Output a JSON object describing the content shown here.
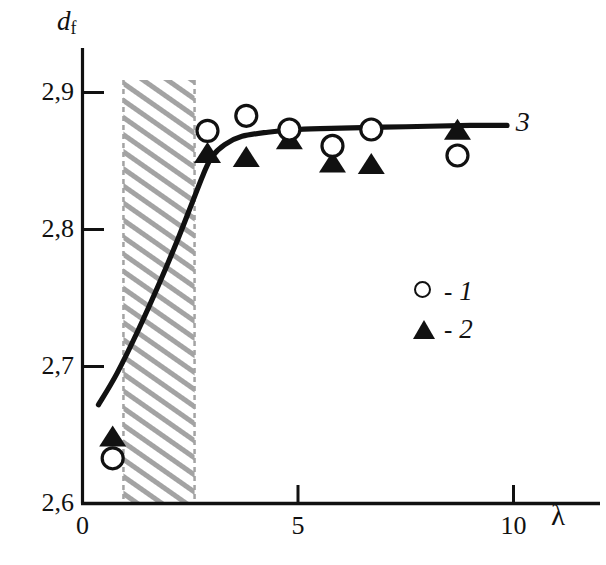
{
  "chart_data": {
    "type": "scatter",
    "title": "",
    "xlabel": "λ",
    "ylabel": "d_f",
    "ylabel_base": "d",
    "ylabel_sub": "f",
    "xlim": [
      0,
      11.6
    ],
    "ylim": [
      2.6,
      2.93
    ],
    "grid": false,
    "xticks": [
      0,
      5,
      10
    ],
    "xtick_labels": [
      "0",
      "5",
      "10"
    ],
    "yticks": [
      2.6,
      2.7,
      2.8,
      2.9
    ],
    "ytick_labels": [
      "2,6",
      "2,7",
      "2,8",
      "2,9"
    ],
    "decimal_separator": ",",
    "legend_position": "center-right",
    "series": [
      {
        "name": "1",
        "legend_label": "1",
        "legend_dash": "-",
        "marker": "open-circle",
        "marker_color": "#111111",
        "points": [
          {
            "x": 0.7,
            "y": 2.633
          },
          {
            "x": 2.9,
            "y": 2.872
          },
          {
            "x": 3.8,
            "y": 2.883
          },
          {
            "x": 4.8,
            "y": 2.873
          },
          {
            "x": 5.8,
            "y": 2.861
          },
          {
            "x": 6.7,
            "y": 2.873
          },
          {
            "x": 8.7,
            "y": 2.854
          }
        ]
      },
      {
        "name": "2",
        "legend_label": "2",
        "legend_dash": "-",
        "marker": "filled-triangle",
        "marker_color": "#111111",
        "points": [
          {
            "x": 0.7,
            "y": 2.648
          },
          {
            "x": 2.9,
            "y": 2.855
          },
          {
            "x": 3.8,
            "y": 2.852
          },
          {
            "x": 4.8,
            "y": 2.865
          },
          {
            "x": 5.8,
            "y": 2.848
          },
          {
            "x": 6.7,
            "y": 2.847
          },
          {
            "x": 8.7,
            "y": 2.872
          }
        ]
      },
      {
        "name": "3",
        "legend_label": "3",
        "marker": "line",
        "marker_color": "#111111",
        "label_x": 10.05,
        "label_y": 2.877,
        "curve": [
          {
            "x": 0.37,
            "y": 2.672
          },
          {
            "x": 0.8,
            "y": 2.695
          },
          {
            "x": 1.3,
            "y": 2.727
          },
          {
            "x": 1.8,
            "y": 2.762
          },
          {
            "x": 2.2,
            "y": 2.792
          },
          {
            "x": 2.55,
            "y": 2.82
          },
          {
            "x": 2.8,
            "y": 2.84
          },
          {
            "x": 3.0,
            "y": 2.853
          },
          {
            "x": 3.3,
            "y": 2.862
          },
          {
            "x": 3.7,
            "y": 2.868
          },
          {
            "x": 4.3,
            "y": 2.871
          },
          {
            "x": 5.0,
            "y": 2.873
          },
          {
            "x": 6.0,
            "y": 2.874
          },
          {
            "x": 7.5,
            "y": 2.875
          },
          {
            "x": 9.0,
            "y": 2.876
          },
          {
            "x": 9.85,
            "y": 2.876
          }
        ]
      }
    ],
    "shaded_region": {
      "name": "hatched-band",
      "x_start": 0.95,
      "x_end": 2.6,
      "pattern": "diagonal-hatch",
      "color": "#9a9a9a",
      "border_style": "dashed"
    }
  }
}
